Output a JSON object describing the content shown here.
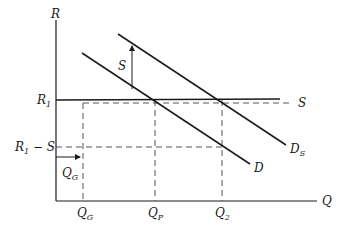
{
  "diagram": {
    "axes": {
      "y_label": "R",
      "x_label": "Q"
    },
    "curves": {
      "demand": "D",
      "shifted_demand": "D",
      "shifted_demand_sub": "S",
      "supply_line": "S"
    },
    "y_ticks": {
      "r1": "R",
      "r1_sub": "1",
      "r1_minus_s_main": "R",
      "r1_minus_s_sub": "1",
      "r1_minus_s_tail": " − S"
    },
    "x_ticks": {
      "qg": "Q",
      "qg_sub": "G",
      "qp": "Q",
      "qp_sub": "P",
      "q2": "Q",
      "q2_sub": "2"
    },
    "annotations": {
      "shift_arrow_label": "S",
      "qg_arrow_label": "Q",
      "qg_arrow_label_sub": "G"
    },
    "colors": {
      "line": "#1a1a1a",
      "dashed": "#555555",
      "background": "#ffffff"
    }
  }
}
